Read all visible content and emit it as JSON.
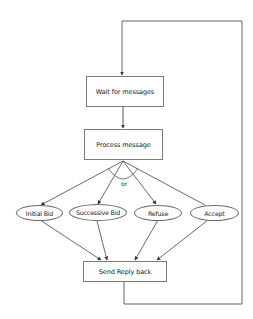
{
  "diagram": {
    "type": "flowchart",
    "nodes": {
      "wait": {
        "label": "Wait for messages",
        "shape": "rectangle"
      },
      "process": {
        "label": "Process message",
        "shape": "rectangle"
      },
      "initial_bid": {
        "label": "Initial Bid",
        "shape": "ellipse"
      },
      "successive_bid": {
        "label": "Successive Bid",
        "shape": "ellipse"
      },
      "refuse": {
        "label": "Refuse",
        "shape": "ellipse"
      },
      "accept": {
        "label": "Accept",
        "shape": "ellipse"
      },
      "send_reply": {
        "label": "Send Reply back",
        "shape": "rectangle"
      }
    },
    "branch_label": "or",
    "edges": [
      {
        "from": "wait",
        "to": "process"
      },
      {
        "from": "process",
        "to": "initial_bid"
      },
      {
        "from": "process",
        "to": "successive_bid"
      },
      {
        "from": "process",
        "to": "refuse"
      },
      {
        "from": "process",
        "to": "accept"
      },
      {
        "from": "initial_bid",
        "to": "send_reply"
      },
      {
        "from": "successive_bid",
        "to": "send_reply"
      },
      {
        "from": "refuse",
        "to": "send_reply"
      },
      {
        "from": "accept",
        "to": "send_reply"
      },
      {
        "from": "send_reply",
        "to": "wait",
        "route": "loop-back-right"
      }
    ],
    "colors": {
      "line": "#555555",
      "border": "#7a7a7a",
      "text": "#222222",
      "background": "#ffffff"
    }
  }
}
